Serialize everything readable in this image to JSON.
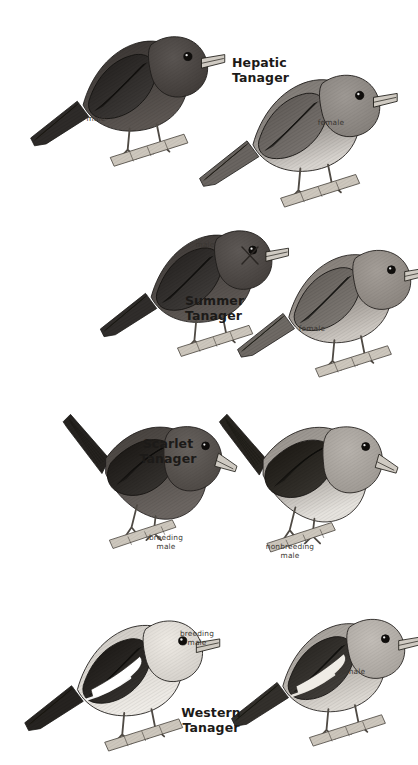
{
  "plate": {
    "title": "Tanagers",
    "background_color": "#ffffff",
    "ink_color": "#1c1a18",
    "annotation_color": "#3a3632",
    "width": 414,
    "height": 765
  },
  "panels": [
    {
      "id": "hepatic-tanager",
      "species_name": "Hepatic\nTanager",
      "label_align": "left",
      "label_x": 232,
      "label_y": 56,
      "birds": [
        {
          "id": "hepatic-male",
          "annotation": "male",
          "anno_x": 96,
          "anno_y": 114,
          "plumage": "dark",
          "pose": "upright",
          "tone_body": "#4a4542",
          "tone_wing": "#2e2b29",
          "tone_belly": "#5c5652",
          "x": 18,
          "y": 8,
          "w": 200,
          "h": 165
        },
        {
          "id": "hepatic-female",
          "annotation": "female",
          "anno_x": 331,
          "anno_y": 118,
          "plumage": "pale",
          "pose": "upright",
          "tone_body": "#8e8984",
          "tone_wing": "#6a6561",
          "tone_belly": "#d8d4cf",
          "x": 186,
          "y": 46,
          "w": 205,
          "h": 168
        }
      ]
    },
    {
      "id": "summer-tanager",
      "species_name": "Summer\nTanager",
      "label_align": "left",
      "label_x": 185,
      "label_y": 294,
      "birds": [
        {
          "id": "summer-male",
          "annotation": "male",
          "anno_x": 205,
          "anno_y": 240,
          "plumage": "dark",
          "pose": "upright",
          "tone_body": "#4e4946",
          "tone_wing": "#302d2b",
          "tone_belly": "#5f5955",
          "x": 90,
          "y": 203,
          "w": 190,
          "h": 160
        },
        {
          "id": "summer-female",
          "annotation": "female",
          "anno_x": 312,
          "anno_y": 324,
          "plumage": "pale",
          "pose": "upright",
          "tone_body": "#948e88",
          "tone_wing": "#6f6a65",
          "tone_belly": "#cdc8c2",
          "x": 228,
          "y": 222,
          "w": 190,
          "h": 162
        }
      ],
      "xmark": {
        "x": 240,
        "y": 245,
        "size": 20
      }
    },
    {
      "id": "scarlet-tanager",
      "species_name": "Scarlet\nTanager",
      "label_align": "center",
      "label_x": 168,
      "label_y": 437,
      "birds": [
        {
          "id": "scarlet-breeding-male",
          "annotation": "breeding\nmale",
          "anno_x": 166,
          "anno_y": 533,
          "plumage": "dark",
          "pose": "leaning",
          "tone_body": "#57524e",
          "tone_wing": "#262320",
          "tone_belly": "#6b6561",
          "x": 52,
          "y": 392,
          "w": 185,
          "h": 165
        },
        {
          "id": "scarlet-nonbreeding-male",
          "annotation": "nonbreeding\nmale",
          "anno_x": 290,
          "anno_y": 542,
          "plumage": "pale",
          "pose": "leaning",
          "tone_body": "#a8a39d",
          "tone_wing": "#27241f",
          "tone_belly": "#e6e3de",
          "x": 208,
          "y": 392,
          "w": 190,
          "h": 168
        }
      ]
    },
    {
      "id": "western-tanager",
      "species_name": "Western\nTanager",
      "label_align": "center",
      "label_x": 211,
      "label_y": 706,
      "birds": [
        {
          "id": "western-breeding-male",
          "annotation": "breeding\nmale",
          "anno_x": 197,
          "anno_y": 629,
          "plumage": "wingbar-bright",
          "pose": "upright",
          "tone_body": "#dedad4",
          "tone_wing": "#262320",
          "tone_belly": "#efece7",
          "x": 15,
          "y": 590,
          "w": 195,
          "h": 170
        },
        {
          "id": "western-female",
          "annotation": "female",
          "anno_x": 352,
          "anno_y": 667,
          "plumage": "wingbar-dull",
          "pose": "upright",
          "tone_body": "#b3aea8",
          "tone_wing": "#33302c",
          "tone_belly": "#ddd9d3",
          "x": 222,
          "y": 588,
          "w": 190,
          "h": 168
        }
      ]
    }
  ]
}
